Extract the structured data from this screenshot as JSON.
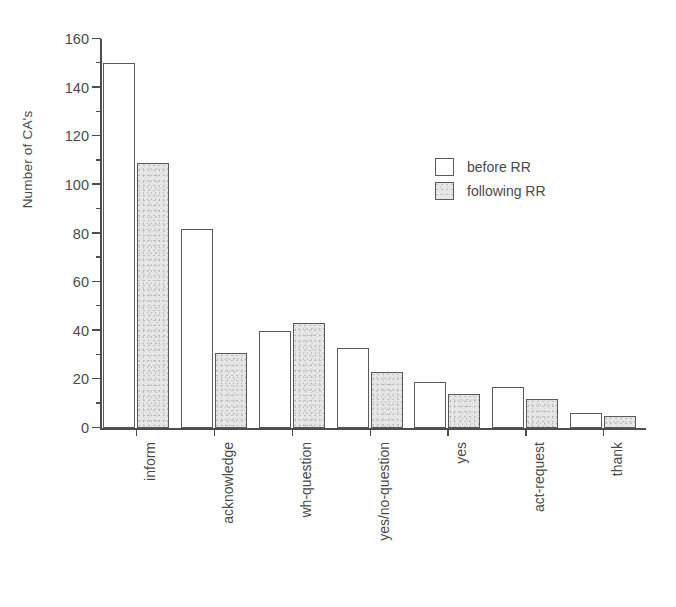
{
  "chart_data": {
    "type": "bar",
    "title": "",
    "xlabel": "",
    "ylabel": "Number of CA's",
    "ylim": [
      0,
      160
    ],
    "ytick_step": 20,
    "yminor_step": 10,
    "grid": false,
    "legend_position": "upper-right-inside",
    "categories": [
      "inform",
      "acknowledge",
      "wh-question",
      "yes/no-question",
      "yes",
      "act-request",
      "thank"
    ],
    "series": [
      {
        "name": "before RR",
        "values": [
          150,
          82,
          40,
          33,
          19,
          17,
          6
        ]
      },
      {
        "name": "following RR",
        "values": [
          109,
          31,
          43,
          23,
          14,
          12,
          5
        ]
      }
    ],
    "ytick_labels": [
      "0",
      "20",
      "40",
      "60",
      "80",
      "100",
      "120",
      "140",
      "160"
    ],
    "ytick_values": [
      0,
      20,
      40,
      60,
      80,
      100,
      120,
      140,
      160
    ],
    "colors": {
      "before_fill": "#ffffff",
      "following_fill": "#e6e6e6",
      "bar_outline": "#5a5a5a",
      "axis": "#4d4d4d",
      "text": "#4a4a4a",
      "background": "#ffffff"
    }
  },
  "legend": {
    "items": [
      {
        "label": "before RR",
        "style": "before"
      },
      {
        "label": "following RR",
        "style": "following"
      }
    ]
  }
}
